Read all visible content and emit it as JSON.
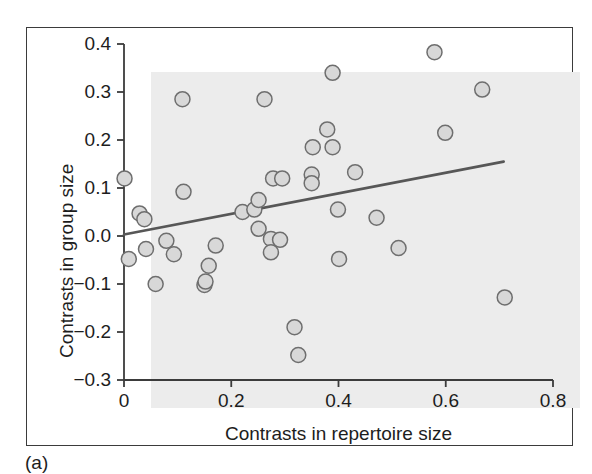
{
  "figure": {
    "panel_caption": "(a)",
    "background_color": "#ffffff",
    "plot_background_color": "#ececec",
    "frame_color": "#3b3b3b",
    "marker_fill": "#d8d8d8",
    "marker_stroke": "#6e6e6e",
    "trendline_color": "#575757",
    "axis_color": "#3b3b3b",
    "text_color": "#1d1d1d"
  },
  "chart_data": {
    "type": "scatter",
    "title": "",
    "xlabel": "Contrasts in repertoire size",
    "ylabel": "Contrasts in group size",
    "xlim": [
      0,
      0.8
    ],
    "ylim": [
      -0.3,
      0.4
    ],
    "xticks": [
      0,
      0.2,
      0.4,
      0.6,
      0.8
    ],
    "xtick_labels": [
      "0",
      "0.2",
      "0.4",
      "0.6",
      "0.8"
    ],
    "yticks": [
      -0.3,
      -0.2,
      -0.1,
      0.0,
      0.1,
      0.2,
      0.3,
      0.4
    ],
    "ytick_labels": [
      "−0.3",
      "−0.2",
      "−0.1",
      "0.0",
      "0.1",
      "0.2",
      "0.3",
      "0.4"
    ],
    "grid": false,
    "legend": null,
    "points": [
      {
        "x": 0.001,
        "y": 0.12
      },
      {
        "x": 0.009,
        "y": -0.048
      },
      {
        "x": 0.029,
        "y": 0.047
      },
      {
        "x": 0.038,
        "y": 0.035
      },
      {
        "x": 0.041,
        "y": -0.027
      },
      {
        "x": 0.059,
        "y": -0.1
      },
      {
        "x": 0.079,
        "y": -0.01
      },
      {
        "x": 0.093,
        "y": -0.038
      },
      {
        "x": 0.109,
        "y": 0.285
      },
      {
        "x": 0.111,
        "y": 0.092
      },
      {
        "x": 0.15,
        "y": -0.102
      },
      {
        "x": 0.152,
        "y": -0.095
      },
      {
        "x": 0.158,
        "y": -0.062
      },
      {
        "x": 0.171,
        "y": -0.02
      },
      {
        "x": 0.221,
        "y": 0.05
      },
      {
        "x": 0.243,
        "y": 0.055
      },
      {
        "x": 0.251,
        "y": 0.075
      },
      {
        "x": 0.251,
        "y": 0.015
      },
      {
        "x": 0.262,
        "y": 0.285
      },
      {
        "x": 0.274,
        "y": -0.006
      },
      {
        "x": 0.274,
        "y": -0.034
      },
      {
        "x": 0.278,
        "y": 0.12
      },
      {
        "x": 0.291,
        "y": -0.008
      },
      {
        "x": 0.295,
        "y": 0.12
      },
      {
        "x": 0.318,
        "y": -0.19
      },
      {
        "x": 0.325,
        "y": -0.248
      },
      {
        "x": 0.35,
        "y": 0.128
      },
      {
        "x": 0.35,
        "y": 0.11
      },
      {
        "x": 0.352,
        "y": 0.185
      },
      {
        "x": 0.379,
        "y": 0.222
      },
      {
        "x": 0.389,
        "y": 0.34
      },
      {
        "x": 0.389,
        "y": 0.185
      },
      {
        "x": 0.399,
        "y": 0.055
      },
      {
        "x": 0.401,
        "y": -0.048
      },
      {
        "x": 0.431,
        "y": 0.133
      },
      {
        "x": 0.471,
        "y": 0.038
      },
      {
        "x": 0.512,
        "y": -0.025
      },
      {
        "x": 0.579,
        "y": 0.383
      },
      {
        "x": 0.599,
        "y": 0.215
      },
      {
        "x": 0.668,
        "y": 0.305
      },
      {
        "x": 0.71,
        "y": -0.128
      }
    ],
    "trendline": {
      "x0": 0.0,
      "y0": 0.003,
      "x1": 0.708,
      "y1": 0.155,
      "slope": 0.215,
      "intercept": 0.003
    },
    "marker_radius_px": 7.5
  }
}
